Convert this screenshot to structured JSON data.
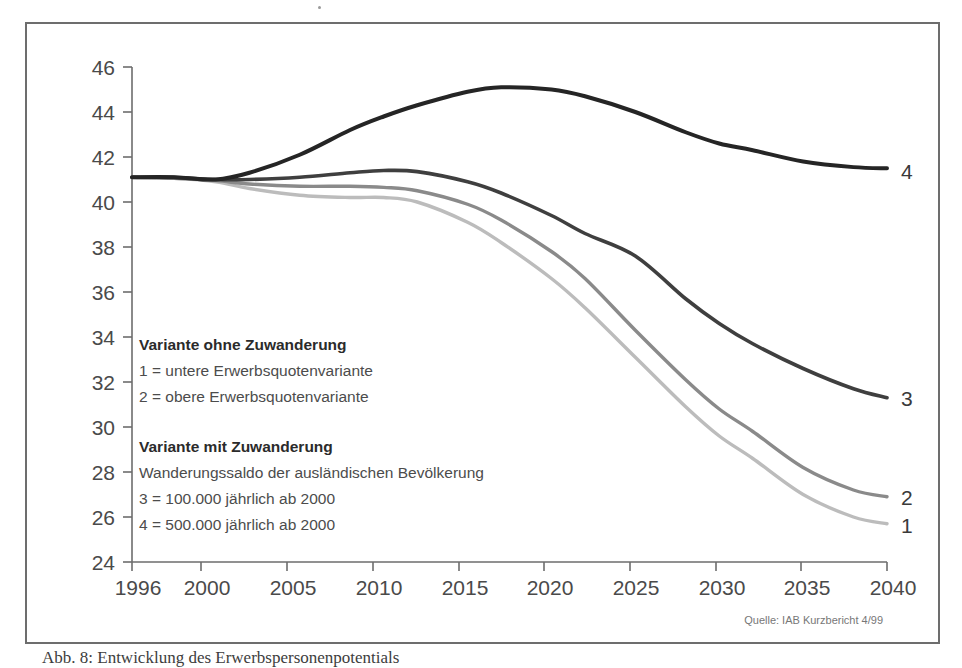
{
  "figure": {
    "frame_color": "#6d6d6d",
    "background": "#ffffff"
  },
  "caption": {
    "text": "Abb. 8: Entwicklung des Erwerbspersonenpotentials"
  },
  "source": {
    "text": "Quelle: IAB Kurzbericht 4/99"
  },
  "legend": {
    "block1_heading": "Variante ohne Zuwanderung",
    "block1_line1": "1 = untere Erwerbsquotenvariante",
    "block1_line2": "2 = obere Erwerbsquotenvariante",
    "block2_heading": "Variante mit Zuwanderung",
    "block2_subtitle": "Wanderungssaldo der ausländischen Bevölkerung",
    "block2_line1": "3 = 100.000 jährlich ab 2000",
    "block2_line2": "4 = 500.000 jährlich ab 2000"
  },
  "end_labels": {
    "curve4": "4",
    "curve3": "3",
    "curve2": "2",
    "curve1": "1"
  },
  "chart_data": {
    "type": "line",
    "title": "",
    "subtitle": "",
    "xlabel": "",
    "ylabel": "",
    "xlim": [
      1996,
      2040
    ],
    "ylim": [
      24,
      46
    ],
    "grid": false,
    "legend_position": "inside-lower-left",
    "x_tick_labels": [
      "1996",
      "2000",
      "2005",
      "2010",
      "2015",
      "2020",
      "2025",
      "2030",
      "2035",
      "2040"
    ],
    "x_ticks": [
      1996,
      2000,
      2005,
      2010,
      2015,
      2020,
      2025,
      2030,
      2035,
      2040
    ],
    "y_tick_labels": [
      "46",
      "44",
      "42",
      "40",
      "38",
      "36",
      "34",
      "32",
      "30",
      "28",
      "26",
      "24"
    ],
    "y_ticks": [
      46,
      44,
      42,
      40,
      38,
      36,
      34,
      32,
      30,
      28,
      26,
      24
    ],
    "x": [
      1996,
      1998,
      2000,
      2002,
      2005,
      2008,
      2010,
      2012,
      2015,
      2017,
      2020,
      2022,
      2025,
      2028,
      2030,
      2032,
      2035,
      2038,
      2040
    ],
    "series": [
      {
        "name": "1 = untere Erwerbsquotenvariante",
        "label": "1",
        "color": "#bcbcbc",
        "values": [
          41.1,
          41.05,
          40.9,
          40.6,
          40.3,
          40.2,
          40.2,
          40.0,
          39.1,
          38.2,
          36.6,
          35.3,
          33.1,
          30.9,
          29.6,
          28.6,
          27.0,
          26.0,
          25.7
        ]
      },
      {
        "name": "2 = obere Erwerbsquotenvariante",
        "label": "2",
        "color": "#8a8a8a",
        "values": [
          41.1,
          41.05,
          40.95,
          40.8,
          40.7,
          40.7,
          40.65,
          40.5,
          39.9,
          39.2,
          37.8,
          36.6,
          34.3,
          32.1,
          30.8,
          29.8,
          28.2,
          27.2,
          26.9
        ]
      },
      {
        "name": "3 = 100.000 jährlich ab 2000",
        "label": "3",
        "color": "#3f3f3f",
        "values": [
          41.1,
          41.1,
          41.0,
          41.0,
          41.1,
          41.3,
          41.4,
          41.35,
          40.9,
          40.4,
          39.4,
          38.6,
          37.6,
          35.7,
          34.6,
          33.7,
          32.6,
          31.7,
          31.3
        ]
      },
      {
        "name": "4 = 500.000 jährlich ab 2000",
        "label": "4",
        "color": "#252525",
        "values": [
          41.1,
          41.1,
          41.0,
          41.3,
          42.1,
          43.2,
          43.8,
          44.3,
          44.9,
          45.1,
          45.0,
          44.7,
          44.0,
          43.1,
          42.6,
          42.3,
          41.8,
          41.55,
          41.5
        ]
      }
    ]
  }
}
